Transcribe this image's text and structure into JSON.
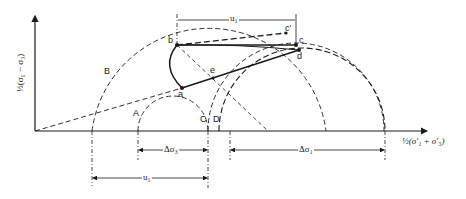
{
  "diagram": {
    "type": "mohr-circle-stress-path",
    "axes": {
      "y_label": "½(σ₁ − σ₃)",
      "x_label": "½(σ′₁ + σ′₃)"
    },
    "points": {
      "a": "a",
      "b": "b",
      "c": "c",
      "c_prime": "c′",
      "d": "d",
      "e": "e"
    },
    "circles": {
      "A": "A",
      "B": "B",
      "C": "C",
      "D": "D"
    },
    "dimensions": {
      "u1_top": "u₁",
      "delta_sigma3": "Δσ₃",
      "delta_sigma1": "Δσ₁",
      "u1_bottom": "u₁"
    },
    "colors": {
      "ink": "#1a1a1a",
      "background": "#ffffff"
    }
  }
}
